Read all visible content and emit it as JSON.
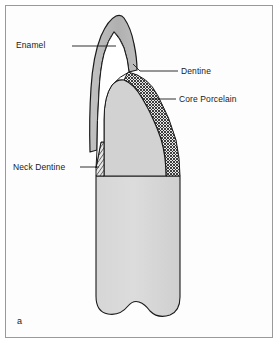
{
  "figure": {
    "letter": "a",
    "frame_color": "#9a9a9a",
    "background_color": "#ffffff",
    "caption_letter_position": "bottom-left"
  },
  "diagram": {
    "type": "anatomical-cross-section",
    "layers": [
      {
        "id": "enamel",
        "label": "Enamel",
        "fill": "#b8b8b8",
        "pattern": "solid-grey",
        "stroke": "#1a1a1a"
      },
      {
        "id": "dentine",
        "label": "Dentine",
        "fill": "#ffffff",
        "pattern": "plain-white",
        "stroke": "#1a1a1a"
      },
      {
        "id": "core-porcelain",
        "label": "Core Porcelain",
        "fill": "#808080",
        "pattern": "cross-hatch",
        "stroke": "#1a1a1a"
      },
      {
        "id": "neck-dentine",
        "label": "Neck Dentine",
        "fill": "#707070",
        "pattern": "diagonal-hatch",
        "stroke": "#1a1a1a"
      },
      {
        "id": "body",
        "label": "",
        "fill": "#d3d3d3",
        "pattern": "solid-light-grey",
        "stroke": "#1a1a1a"
      }
    ],
    "labels": [
      {
        "id": "enamel",
        "text": "Enamel",
        "side": "left",
        "leader_from_x": 72,
        "leader_from_y": 46,
        "leader_to_x": 116,
        "leader_to_y": 46
      },
      {
        "id": "dentine",
        "text": "Dentine",
        "side": "right",
        "leader_from_x": 178,
        "leader_from_y": 71,
        "leader_to_x": 137,
        "leader_to_y": 68
      },
      {
        "id": "core-porcelain",
        "text": "Core Porcelain",
        "side": "right",
        "leader_from_x": 176,
        "leader_from_y": 99,
        "leader_to_x": 150,
        "leader_to_y": 99
      },
      {
        "id": "neck-dentine",
        "text": "Neck Dentine",
        "side": "left",
        "leader_from_x": 80,
        "leader_from_y": 167,
        "leader_to_x": 99,
        "leader_to_y": 167
      }
    ],
    "leader_line_color": "#1a1a1a",
    "text_color": "#1a1a1a"
  }
}
